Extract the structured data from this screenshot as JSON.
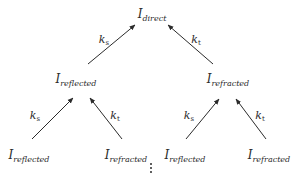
{
  "diagram": {
    "type": "tree",
    "nodes": {
      "root": {
        "symbol": "I",
        "subscript": "direct"
      },
      "l1_left": {
        "symbol": "I",
        "subscript": "reflected"
      },
      "l1_right": {
        "symbol": "I",
        "subscript": "refracted"
      },
      "l2_1": {
        "symbol": "I",
        "subscript": "reflected"
      },
      "l2_2": {
        "symbol": "I",
        "subscript": "refracted"
      },
      "l2_3": {
        "symbol": "I",
        "subscript": "reflected"
      },
      "l2_4": {
        "symbol": "I",
        "subscript": "refracted"
      }
    },
    "edges": [
      {
        "from": "l1_left",
        "to": "root",
        "label": {
          "symbol": "k",
          "subscript": "s"
        }
      },
      {
        "from": "l1_right",
        "to": "root",
        "label": {
          "symbol": "k",
          "subscript": "t"
        }
      },
      {
        "from": "l2_1",
        "to": "l1_left",
        "label": {
          "symbol": "k",
          "subscript": "s"
        }
      },
      {
        "from": "l2_2",
        "to": "l1_left",
        "label": {
          "symbol": "k",
          "subscript": "t"
        }
      },
      {
        "from": "l2_3",
        "to": "l1_right",
        "label": {
          "symbol": "k",
          "subscript": "s"
        }
      },
      {
        "from": "l2_4",
        "to": "l1_right",
        "label": {
          "symbol": "k",
          "subscript": "t"
        }
      }
    ],
    "continuation": "vertical-ellipsis",
    "colors": {
      "ink": "#2b2b2b",
      "background": "#ffffff"
    }
  }
}
